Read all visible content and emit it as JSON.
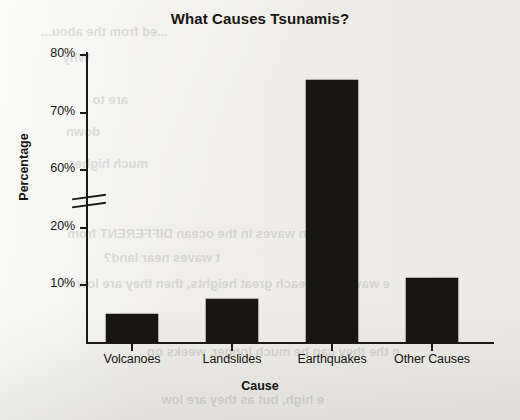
{
  "chart_data": {
    "type": "bar",
    "title": "What Causes Tsunamis?",
    "xlabel": "Cause",
    "ylabel": "Percentage",
    "categories": [
      "Volcanoes",
      "Landslides",
      "Earthquakes",
      "Other Causes"
    ],
    "values": [
      5,
      7.5,
      75.7,
      11.2
    ],
    "value_labels": [
      "5%",
      "7.5%",
      "75.7%",
      "11.2%"
    ],
    "grid": false,
    "legend": "none",
    "bar_color": "#17160f",
    "axis_color": "#1b1a16",
    "background_color": "#efeeea",
    "axis_break": true,
    "axis_break_note": "y-axis is broken between 20% and 60%",
    "ylim": [
      0,
      80
    ],
    "yticks": [
      {
        "label": "80%",
        "value": 80
      },
      {
        "label": "70%",
        "value": 70
      },
      {
        "label": "60%",
        "value": 60
      },
      {
        "label": "20%",
        "value": 20
      },
      {
        "label": "10%",
        "value": 10
      }
    ]
  },
  "bleed_text": [
    {
      "text": "...ed from the abou...",
      "x": 352,
      "y": 24
    },
    {
      "text": "Why",
      "x": 430,
      "y": 50
    },
    {
      "text": "are to",
      "x": 392,
      "y": 92
    },
    {
      "text": "down",
      "x": 420,
      "y": 124
    },
    {
      "text": "much higher",
      "x": 372,
      "y": 156
    },
    {
      "text": "e certain waves in the ocean DIFFERENT from",
      "x": 168,
      "y": 226
    },
    {
      "text": "t waves near land?",
      "x": 300,
      "y": 250
    },
    {
      "text": "e waves can reach great heights, then they are low",
      "x": 130,
      "y": 276
    },
    {
      "text": "e high, but as they are low",
      "x": 196,
      "y": 392
    },
    {
      "text": "n the they can be much longer, weeks on",
      "x": 120,
      "y": 344
    }
  ]
}
